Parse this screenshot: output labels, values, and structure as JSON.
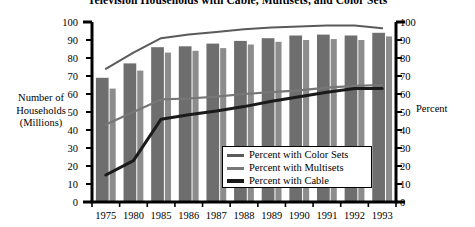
{
  "chart_data": {
    "type": "bar",
    "title": "Television Households with Cable, Multisets, and Color Sets",
    "xlabel": "",
    "ylabel": "Number of Households (Millions)",
    "ylabel_right": "Percent",
    "ylim": [
      0,
      100
    ],
    "ylim_right": [
      0,
      100
    ],
    "ytick_labels": [
      "100",
      "90",
      "80",
      "70",
      "60",
      "50",
      "40",
      "30",
      "20",
      "10",
      "0"
    ],
    "ytick_values": [
      100,
      90,
      80,
      70,
      60,
      50,
      40,
      30,
      20,
      10,
      0
    ],
    "ytick_labels_right": [
      "100",
      "90",
      "80",
      "70",
      "60",
      "50",
      "40",
      "30",
      "20",
      "10",
      "0"
    ],
    "grid": false,
    "legend_position": "inside lower right",
    "categories": [
      "1975",
      "1980",
      "1985",
      "1986",
      "1987",
      "1988",
      "1989",
      "1990",
      "1991",
      "1992",
      "1993"
    ],
    "bar_series": [
      {
        "name": "TV Households (Millions)",
        "color": "#6e6e6e",
        "values": [
          69,
          77,
          86,
          86.5,
          88,
          89.5,
          91,
          92.5,
          93,
          92.5,
          94
        ]
      },
      {
        "name": "Households with Color Sets (Millions)",
        "color": "#8c8c8c",
        "values": [
          63,
          73,
          83,
          84,
          85.5,
          87.5,
          89,
          90,
          90.5,
          90,
          92
        ]
      }
    ],
    "line_series": [
      {
        "name": "Percent with Color Sets",
        "color": "#5a5a5a",
        "width": 2.0,
        "values": [
          74,
          83,
          91,
          93,
          94.5,
          96,
          97,
          97.5,
          98,
          98,
          96.5
        ]
      },
      {
        "name": "Percent with Multisets",
        "color": "#777777",
        "width": 2.2,
        "values": [
          43,
          50,
          57,
          57.5,
          58.5,
          60,
          61,
          62,
          63.5,
          64.5,
          65
        ]
      },
      {
        "name": "Percent with Cable",
        "color": "#1a1a1a",
        "width": 3.0,
        "values": [
          15,
          23,
          46,
          48.5,
          50.5,
          53,
          56,
          58.5,
          61,
          63,
          63
        ]
      }
    ]
  },
  "legend": {
    "items": [
      {
        "label": "Percent with Color Sets",
        "color": "#5a5a5a",
        "thickness": 3
      },
      {
        "label": "Percent with Multisets",
        "color": "#777777",
        "thickness": 3
      },
      {
        "label": "Percent with Cable",
        "color": "#1a1a1a",
        "thickness": 4
      }
    ]
  },
  "colors": {
    "bar_main": "#6e6e6e",
    "bar_secondary": "#8c8c8c",
    "axis": "#000000",
    "background": "#ffffff"
  }
}
